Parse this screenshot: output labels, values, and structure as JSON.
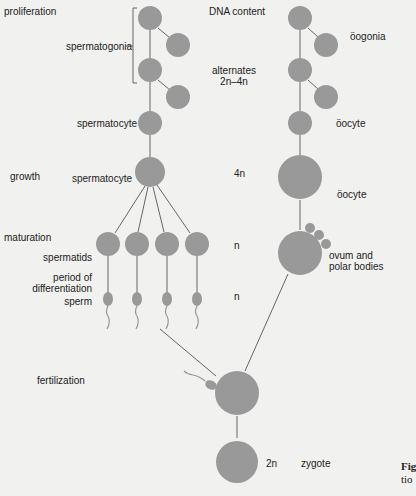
{
  "stages": {
    "proliferation": "proliferation",
    "growth": "growth",
    "maturation": "maturation",
    "fertilization": "fertilization"
  },
  "column_header": "DNA content",
  "male": {
    "spermatogonia": "spermatogonia",
    "spermatocyte_1": "spermatocyte",
    "spermatocyte_2": "spermatocyte",
    "spermatids": "spermatids",
    "differentiation_1": "period of",
    "differentiation_2": "differentiation",
    "sperm": "sperm"
  },
  "dna": {
    "proliferation_1": "alternates",
    "proliferation_2": "2n–4n",
    "growth": "4n",
    "maturation": "n",
    "sperm": "n",
    "zygote": "2n"
  },
  "female": {
    "oogonia": "öogonia",
    "oocyte_1": "öocyte",
    "oocyte_2": "öocyte",
    "ovum_1": "ovum and",
    "ovum_2": "polar bodies"
  },
  "zygote": "zygote",
  "caption": {
    "line1": "Fig",
    "line2": "tio"
  },
  "colors": {
    "cell": "#999999",
    "line": "#555555",
    "background": "#f1f1ef"
  }
}
